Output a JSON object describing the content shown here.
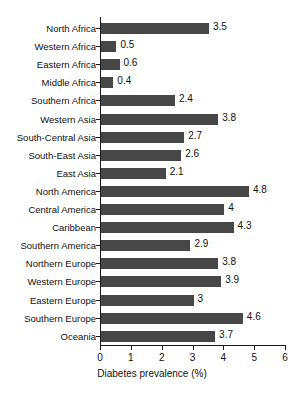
{
  "figure": {
    "top_caption": "",
    "bar_color": "#474747",
    "axis_color": "#1a1a1a",
    "text_color": "#111111",
    "background": "#ffffff"
  },
  "chart_data": {
    "type": "bar",
    "orientation": "horizontal",
    "title": "",
    "xlabel": "Diabetes prevalence (%)",
    "ylabel": "",
    "xlim": [
      0,
      6
    ],
    "xticks": [
      0,
      1,
      2,
      3,
      4,
      5,
      6
    ],
    "xtick_labels": [
      "0",
      "1",
      "2",
      "3",
      "4",
      "5",
      "6"
    ],
    "grid": false,
    "legend": false,
    "categories": [
      "North Africa",
      "Western Africa",
      "Eastern Africa",
      "Middle Africa",
      "Southern Africa",
      "Western Asia",
      "South-Central Asia",
      "South-East Asia",
      "East Asia",
      "North America",
      "Central America",
      "Caribbean",
      "Southern America",
      "Northern Europe",
      "Western Europe",
      "Eastern Europe",
      "Southern Europe",
      "Oceania"
    ],
    "values": [
      3.5,
      0.5,
      0.6,
      0.4,
      2.4,
      3.8,
      2.7,
      2.6,
      2.1,
      4.8,
      4,
      4.3,
      2.9,
      3.8,
      3.9,
      3,
      4.6,
      3.7
    ],
    "value_labels": [
      "3.5",
      "0.5",
      "0.6",
      "0.4",
      "2.4",
      "3.8",
      "2.7",
      "2.6",
      "2.1",
      "4.8",
      "4",
      "4.3",
      "2.9",
      "3.8",
      "3.9",
      "3",
      "4.6",
      "3.7"
    ]
  }
}
